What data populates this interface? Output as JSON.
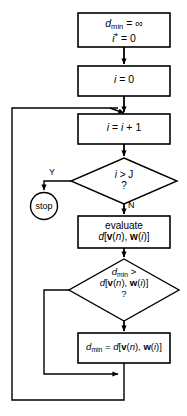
{
  "diagram": {
    "colors": {
      "stroke": "#000000",
      "fill": "#ffffff",
      "text": "#000000"
    },
    "nodes": {
      "init": {
        "shape": "process",
        "line1_a": "d",
        "line1_sub": "min",
        "line1_b": " = ",
        "line1_c": "∞",
        "line2_a": "i",
        "line2_sup": "*",
        "line2_b": " = 0"
      },
      "reset_i": {
        "shape": "process",
        "a": "i",
        "b": " = 0"
      },
      "increment_i": {
        "shape": "process",
        "a": "i",
        "b": " = ",
        "c": "i",
        "d": " + 1"
      },
      "test_bound": {
        "shape": "decision",
        "line1_a": "i",
        "line1_b": " > ",
        "line1_c": "J",
        "line2": "?"
      },
      "stop": {
        "shape": "terminator",
        "label": "stop"
      },
      "evaluate": {
        "shape": "process",
        "line1": "evaluate",
        "line2_d": "d",
        "line2_ob": "[",
        "line2_v": "v",
        "line2_vp": "(",
        "line2_n": "n",
        "line2_vq": "), ",
        "line2_w": "w",
        "line2_wp": "(",
        "line2_i": "i",
        "line2_wq": ")]"
      },
      "test_min": {
        "shape": "decision",
        "line1_a": "d",
        "line1_sub": "min",
        "line1_b": " >",
        "line2_d": "d",
        "line2_ob": "[",
        "line2_v": "v",
        "line2_vp": "(",
        "line2_n": "n",
        "line2_vq": "), ",
        "line2_w": "w",
        "line2_wp": "(",
        "line2_i": "i",
        "line2_wq": ")]",
        "line3": "?"
      },
      "update_min": {
        "shape": "process",
        "a": "d",
        "sub": "min",
        "b": " = ",
        "d": "d",
        "ob": "[",
        "v": "v",
        "vp": "(",
        "n": "n",
        "vq": "), ",
        "w": "w",
        "wp": "(",
        "i": "i",
        "wq": ")]"
      }
    },
    "branch_labels": {
      "yes": "Y",
      "no": "N"
    }
  }
}
